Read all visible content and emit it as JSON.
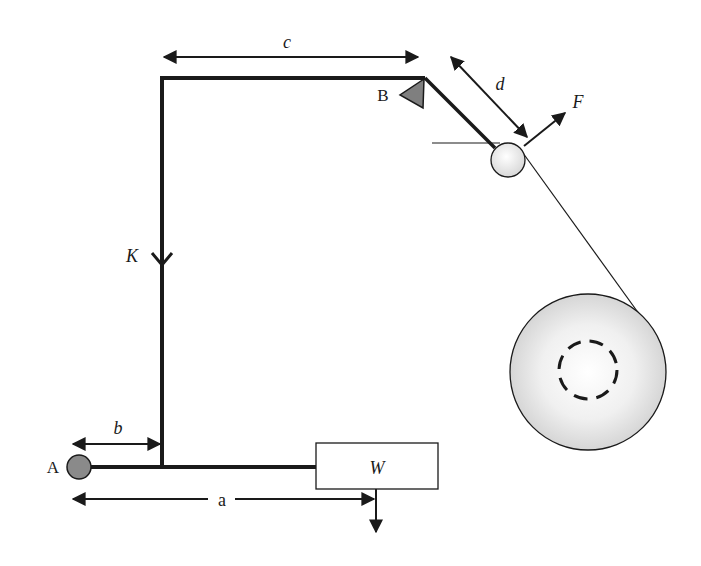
{
  "diagram": {
    "type": "mechanical lever / tension arm schematic",
    "labels": {
      "pivot_A": "A",
      "pivot_B": "B",
      "dim_a": "a",
      "dim_b": "b",
      "dim_c": "c",
      "dim_d": "d",
      "force_F": "F",
      "spring_K": "K",
      "weight_W": "W"
    },
    "colors": {
      "line": "#1a1a1a",
      "pivot_fill": "#8a8a8a",
      "triangle_fill": "#7f7f7f",
      "roller_fill": "#e6e6e6",
      "reel_fill": "#d9d9d9",
      "background": "#ffffff"
    },
    "elements": [
      {
        "id": "pivot-A",
        "shape": "circle",
        "description": "grey fixed pivot at left end of lower arm"
      },
      {
        "id": "lower-arm",
        "shape": "line",
        "description": "horizontal arm from A to weight box"
      },
      {
        "id": "weight-box",
        "shape": "rectangle",
        "label": "W",
        "description": "weight with downward force arrow"
      },
      {
        "id": "vertical-link",
        "shape": "line",
        "label": "K",
        "description": "vertical link with downward arrow"
      },
      {
        "id": "top-arm",
        "shape": "line",
        "description": "horizontal top arm to pivot B"
      },
      {
        "id": "pivot-B",
        "shape": "triangle",
        "label": "B"
      },
      {
        "id": "dancer-arm",
        "shape": "line",
        "description": "diagonal arm from B to roller"
      },
      {
        "id": "roller",
        "shape": "circle",
        "description": "small roller at end of dancer arm"
      },
      {
        "id": "force-F",
        "shape": "arrow",
        "label": "F"
      },
      {
        "id": "web-line",
        "shape": "line",
        "description": "material web from roller to reel"
      },
      {
        "id": "reel",
        "shape": "circle",
        "description": "large reel with dashed core circle"
      }
    ]
  }
}
